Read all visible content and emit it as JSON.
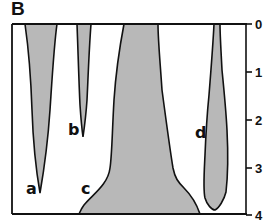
{
  "panel": {
    "label": "B"
  },
  "axis": {
    "orientation": "vertical-right",
    "ticks": [
      {
        "value": 0,
        "label": "0",
        "y": 24
      },
      {
        "value": 1,
        "label": "1",
        "y": 72
      },
      {
        "value": 2,
        "label": "2",
        "y": 120
      },
      {
        "value": 3,
        "label": "3",
        "y": 168
      },
      {
        "value": 4,
        "label": "4",
        "y": 215
      }
    ],
    "range": [
      0,
      4
    ],
    "direction": "increasing-downward"
  },
  "shapes": [
    {
      "id": "a",
      "label": "a",
      "description": "tapering downward, tip near depth 3.5"
    },
    {
      "id": "b",
      "label": "b",
      "description": "narrow tapering downward, tip near depth 2.4"
    },
    {
      "id": "c",
      "label": "c",
      "description": "widening downward, reaches depth 4"
    },
    {
      "id": "d",
      "label": "d",
      "description": "narrow at top, widening, rounded bottom near depth 3.9"
    }
  ],
  "colors": {
    "fill": "#b8b8b8",
    "stroke": "#111111",
    "background": "#ffffff"
  }
}
